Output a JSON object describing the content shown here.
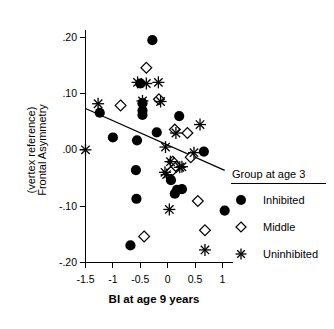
{
  "chart_data": {
    "type": "scatter",
    "title": "",
    "xlabel": "BI at age 9 years",
    "ylabel_line1": "Frontal Asymmetry",
    "ylabel_line2": "(vertex reference)",
    "xlim": [
      -1.68,
      1.16
    ],
    "ylim": [
      -0.22,
      0.222
    ],
    "grid": false,
    "legend_position": "bottom-right",
    "xticks": [
      -1.5,
      -1,
      -0.5,
      0,
      0.5,
      1
    ],
    "xticklabels": [
      "-1.5",
      "-1",
      "-0.5",
      "0",
      "0.5",
      "1"
    ],
    "yticks": [
      0.2,
      0.1,
      0.0,
      -0.1,
      -0.2
    ],
    "yticklabels": [
      ".20",
      ".10",
      ".00",
      "-.10",
      "-.20"
    ],
    "legend": {
      "title": "Group at age 3",
      "entries": [
        {
          "label": "Inhibited",
          "marker": "filled-circle"
        },
        {
          "label": "Middle",
          "marker": "open-diamond"
        },
        {
          "label": "Uninhibited",
          "marker": "asterisk"
        }
      ]
    },
    "trendline": {
      "x_start": -1.5,
      "y_start": 0.0735,
      "x_end": 1.04,
      "y_end": -0.0365,
      "slope": -0.0433,
      "intercept": 0.0085
    },
    "series": [
      {
        "name": "Inhibited",
        "marker": "filled-circle",
        "points": [
          [
            -0.28,
            0.195
          ],
          [
            -0.5,
            0.118
          ],
          [
            -0.46,
            0.083
          ],
          [
            -0.46,
            0.07
          ],
          [
            -0.46,
            0.062
          ],
          [
            -1.24,
            0.066
          ],
          [
            -1.0,
            0.022
          ],
          [
            -0.56,
            0.017
          ],
          [
            -0.2,
            0.031
          ],
          [
            0.21,
            0.06
          ],
          [
            0.66,
            -0.003
          ],
          [
            -0.58,
            -0.036
          ],
          [
            0.06,
            -0.054
          ],
          [
            0.13,
            -0.078
          ],
          [
            0.26,
            -0.07
          ],
          [
            0.17,
            -0.071
          ],
          [
            -0.57,
            -0.087
          ],
          [
            1.04,
            -0.108
          ],
          [
            -0.68,
            -0.17
          ]
        ]
      },
      {
        "name": "Middle",
        "marker": "open-diamond",
        "points": [
          [
            -0.39,
            0.146
          ],
          [
            -0.86,
            0.079
          ],
          [
            -0.16,
            0.09
          ],
          [
            0.13,
            0.036
          ],
          [
            0.36,
            0.03
          ],
          [
            0.42,
            -0.013
          ],
          [
            0.09,
            -0.021
          ],
          [
            0.06,
            -0.039
          ],
          [
            0.16,
            -0.03
          ],
          [
            0.55,
            -0.091
          ],
          [
            -0.43,
            -0.154
          ],
          [
            0.68,
            -0.143
          ]
        ]
      },
      {
        "name": "Uninhibited",
        "marker": "asterisk",
        "points": [
          [
            -0.55,
            0.12
          ],
          [
            -0.39,
            0.118
          ],
          [
            -0.17,
            0.12
          ],
          [
            -0.46,
            0.087
          ],
          [
            -0.13,
            0.086
          ],
          [
            -1.27,
            0.082
          ],
          [
            0.59,
            0.045
          ],
          [
            0.15,
            0.03
          ],
          [
            -0.04,
            0.005
          ],
          [
            -1.5,
            0.0
          ],
          [
            0.48,
            -0.005
          ],
          [
            0.05,
            -0.021
          ],
          [
            0.22,
            -0.031
          ],
          [
            -0.05,
            -0.04
          ],
          [
            -0.02,
            -0.044
          ],
          [
            0.26,
            -0.03
          ],
          [
            0.03,
            -0.106
          ],
          [
            0.68,
            -0.178
          ]
        ]
      }
    ]
  }
}
